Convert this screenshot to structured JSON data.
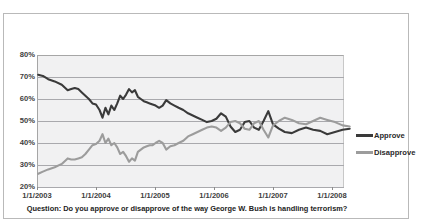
{
  "caption": "Question: Do you approve or disapprove of the way George W. Bush is handling terrorism?",
  "legend": {
    "items": [
      {
        "label": "Approve",
        "color": "#3a3a3a"
      },
      {
        "label": "Disapprove",
        "color": "#9c9c9c"
      }
    ]
  },
  "axis": {
    "y_ticks": [
      "20%",
      "30%",
      "40%",
      "50%",
      "60%",
      "70%",
      "80%"
    ],
    "x_ticks": [
      "1/1/2003",
      "1/1/2004",
      "1/1/2005",
      "1/1/2006",
      "1/1/2007",
      "1/1/2008"
    ]
  },
  "chart_data": {
    "type": "line",
    "title": "",
    "subtitle": "",
    "xlabel": "",
    "ylabel": "",
    "caption": "Question: Do you approve or disapprove of the way George W. Bush is handling terrorism?",
    "grid": true,
    "grid_orientation": "horizontal",
    "legend_position": "right",
    "ylim": [
      20,
      80
    ],
    "ytick_values": [
      20,
      30,
      40,
      50,
      60,
      70,
      80
    ],
    "ytick_labels": [
      "20%",
      "30%",
      "40%",
      "50%",
      "60%",
      "70%",
      "80%"
    ],
    "xlim": [
      "1/1/2003",
      "1/1/2008.3"
    ],
    "xtick_labels": [
      "1/1/2003",
      "1/1/2004",
      "1/1/2005",
      "1/1/2006",
      "1/1/2007",
      "1/1/2008"
    ],
    "xtick_positions_years": [
      2003.0,
      2004.0,
      2005.0,
      2006.0,
      2007.0,
      2008.0
    ],
    "x_unit": "decimal year",
    "series": [
      {
        "name": "Approve",
        "color": "#3a3a3a",
        "x": [
          2003.02,
          2003.1,
          2003.19,
          2003.3,
          2003.42,
          2003.52,
          2003.58,
          2003.64,
          2003.7,
          2003.76,
          2003.82,
          2003.88,
          2003.94,
          2004.0,
          2004.06,
          2004.11,
          2004.16,
          2004.21,
          2004.26,
          2004.31,
          2004.36,
          2004.41,
          2004.46,
          2004.51,
          2004.56,
          2004.61,
          2004.66,
          2004.71,
          2004.76,
          2004.81,
          2004.86,
          2004.91,
          2004.96,
          2005.01,
          2005.07,
          2005.13,
          2005.19,
          2005.26,
          2005.33,
          2005.4,
          2005.48,
          2005.56,
          2005.64,
          2005.72,
          2005.8,
          2005.88,
          2005.96,
          2006.04,
          2006.12,
          2006.2,
          2006.28,
          2006.36,
          2006.44,
          2006.52,
          2006.6,
          2006.68,
          2006.76,
          2006.84,
          2006.92,
          2007.0,
          2007.1,
          2007.2,
          2007.32,
          2007.44,
          2007.56,
          2007.68,
          2007.8,
          2007.92,
          2008.05,
          2008.18,
          2008.3
        ],
        "y": [
          71,
          70.5,
          69,
          68,
          66.5,
          64,
          64.5,
          65,
          64.5,
          63,
          61.5,
          60,
          58,
          57.5,
          55,
          51.5,
          56,
          53,
          57,
          55,
          58,
          61.5,
          60,
          62,
          64.5,
          63,
          64,
          61,
          60,
          59,
          58.5,
          58,
          57.5,
          57,
          56,
          57,
          59.5,
          58,
          57,
          56,
          55,
          53.5,
          52.5,
          51.5,
          50.5,
          49.5,
          50,
          51,
          53.5,
          52,
          47.5,
          45,
          46,
          49.5,
          50,
          47,
          46,
          50,
          54.5,
          48.5,
          46.5,
          45,
          44.5,
          46,
          47,
          46,
          45.5,
          44,
          45,
          46,
          46.5
        ]
      },
      {
        "name": "Disapprove",
        "color": "#9c9c9c",
        "x": [
          2003.02,
          2003.1,
          2003.19,
          2003.3,
          2003.42,
          2003.52,
          2003.58,
          2003.64,
          2003.7,
          2003.76,
          2003.82,
          2003.88,
          2003.94,
          2004.0,
          2004.06,
          2004.11,
          2004.16,
          2004.21,
          2004.26,
          2004.31,
          2004.36,
          2004.41,
          2004.46,
          2004.51,
          2004.56,
          2004.61,
          2004.66,
          2004.71,
          2004.76,
          2004.81,
          2004.86,
          2004.91,
          2004.96,
          2005.01,
          2005.07,
          2005.13,
          2005.19,
          2005.26,
          2005.33,
          2005.4,
          2005.48,
          2005.56,
          2005.64,
          2005.72,
          2005.8,
          2005.88,
          2005.96,
          2006.04,
          2006.12,
          2006.2,
          2006.28,
          2006.36,
          2006.44,
          2006.52,
          2006.6,
          2006.68,
          2006.76,
          2006.84,
          2006.92,
          2007.0,
          2007.1,
          2007.2,
          2007.32,
          2007.44,
          2007.56,
          2007.68,
          2007.8,
          2007.92,
          2008.05,
          2008.18,
          2008.3
        ],
        "y": [
          26,
          27,
          28,
          29,
          30.5,
          33,
          32.5,
          32.5,
          33,
          33.5,
          35,
          37,
          39,
          39.5,
          41,
          44,
          40,
          42,
          39,
          40,
          38,
          35,
          36,
          34,
          31.5,
          33,
          32,
          36,
          37,
          38,
          38.5,
          39,
          39,
          40,
          41,
          40,
          37,
          38.5,
          39,
          40,
          41,
          43,
          44,
          45,
          46,
          47,
          47.5,
          47,
          45.5,
          47,
          49.5,
          50,
          49,
          46.5,
          46,
          49,
          50,
          46,
          42.5,
          48,
          50,
          51.5,
          50.5,
          49,
          48.5,
          50,
          51.5,
          50.5,
          49.5,
          48,
          47.5
        ]
      }
    ]
  }
}
